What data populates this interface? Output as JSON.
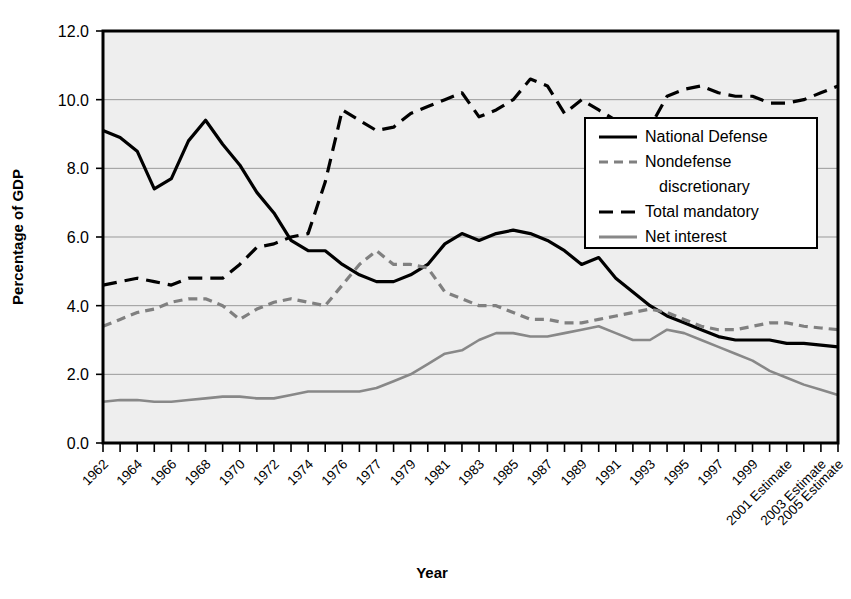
{
  "chart_data": {
    "type": "line",
    "title": "",
    "xlabel": "Year",
    "ylabel": "Percentage of GDP",
    "ylim": [
      0.0,
      12.0
    ],
    "ytick_labels": [
      "0.0",
      "2.0",
      "4.0",
      "6.0",
      "8.0",
      "10.0",
      "12.0"
    ],
    "ytick_values": [
      0,
      2,
      4,
      6,
      8,
      10,
      12
    ],
    "grid": "horizontal",
    "legend_position": "inside-right-upper",
    "x": [
      1962,
      1963,
      1964,
      1965,
      1966,
      1967,
      1968,
      1969,
      1970,
      1971,
      1972,
      1973,
      1974,
      1975,
      1976,
      1977,
      1978,
      1979,
      1980,
      1981,
      1982,
      1983,
      1984,
      1985,
      1986,
      1987,
      1988,
      1989,
      1990,
      1991,
      1992,
      1993,
      1994,
      1995,
      1996,
      1997,
      1998,
      1999,
      2000,
      2001,
      2002,
      2003,
      2004,
      2005
    ],
    "xtick_labels": [
      "1962",
      "1964",
      "1966",
      "1968",
      "1970",
      "1972",
      "1974",
      "1976",
      "1977",
      "1979",
      "1981",
      "1983",
      "1985",
      "1987",
      "1989",
      "1991",
      "1993",
      "1995",
      "1997",
      "1999",
      "2001 Estimate",
      "2003 Estimate",
      "2005 Estimate"
    ],
    "xtick_positions": [
      1962,
      1964,
      1966,
      1968,
      1970,
      1972,
      1974,
      1976,
      1978,
      1980,
      1982,
      1984,
      1986,
      1988,
      1990,
      1992,
      1994,
      1996,
      1998,
      2000,
      2002,
      2004,
      2005
    ],
    "series": [
      {
        "name": "National Defense",
        "style": "solid",
        "color": "#000000",
        "values": [
          9.1,
          8.9,
          8.5,
          7.4,
          7.7,
          8.8,
          9.4,
          8.7,
          8.1,
          7.3,
          6.7,
          5.9,
          5.6,
          5.6,
          5.2,
          4.9,
          4.7,
          4.7,
          4.9,
          5.2,
          5.8,
          6.1,
          5.9,
          6.1,
          6.2,
          6.1,
          5.9,
          5.6,
          5.2,
          5.4,
          4.8,
          4.4,
          4.0,
          3.7,
          3.5,
          3.3,
          3.1,
          3.0,
          3.0,
          3.0,
          2.9,
          2.9,
          2.85,
          2.8
        ]
      },
      {
        "name": "Nondefense discretionary",
        "style": "dashed",
        "color": "#808080",
        "values": [
          3.4,
          3.6,
          3.8,
          3.9,
          4.1,
          4.2,
          4.2,
          4.0,
          3.6,
          3.9,
          4.1,
          4.2,
          4.1,
          4.0,
          4.6,
          5.2,
          5.6,
          5.2,
          5.2,
          5.1,
          4.4,
          4.2,
          4.0,
          4.0,
          3.8,
          3.6,
          3.6,
          3.5,
          3.5,
          3.6,
          3.7,
          3.8,
          3.9,
          3.8,
          3.6,
          3.4,
          3.3,
          3.3,
          3.4,
          3.5,
          3.5,
          3.4,
          3.35,
          3.3
        ]
      },
      {
        "name": "Total mandatory",
        "style": "longdash",
        "color": "#000000",
        "values": [
          4.6,
          4.7,
          4.8,
          4.7,
          4.6,
          4.8,
          4.8,
          4.8,
          5.2,
          5.7,
          5.8,
          6.0,
          6.1,
          7.6,
          9.7,
          9.4,
          9.1,
          9.2,
          9.6,
          9.8,
          10.0,
          10.2,
          9.5,
          9.7,
          10.0,
          10.6,
          10.4,
          9.6,
          10.0,
          9.7,
          9.4,
          8.9,
          9.2,
          10.1,
          10.3,
          10.4,
          10.2,
          10.1,
          10.1,
          9.9,
          9.9,
          10.0,
          10.2,
          10.4
        ]
      },
      {
        "name": "Net interest",
        "style": "solid",
        "color": "#888888",
        "values": [
          1.2,
          1.25,
          1.25,
          1.2,
          1.2,
          1.25,
          1.3,
          1.35,
          1.35,
          1.3,
          1.3,
          1.4,
          1.5,
          1.5,
          1.5,
          1.5,
          1.6,
          1.8,
          2.0,
          2.3,
          2.6,
          2.7,
          3.0,
          3.2,
          3.2,
          3.1,
          3.1,
          3.2,
          3.3,
          3.4,
          3.2,
          3.0,
          3.0,
          3.3,
          3.2,
          3.0,
          2.8,
          2.6,
          2.4,
          2.1,
          1.9,
          1.7,
          1.55,
          1.4
        ]
      }
    ]
  },
  "legend": {
    "items": [
      {
        "label": "National Defense"
      },
      {
        "label": "Nondefense"
      },
      {
        "label": "discretionary"
      },
      {
        "label": "Total mandatory"
      },
      {
        "label": "Net interest"
      }
    ]
  },
  "axes": {
    "y_title": "Percentage of GDP",
    "x_title": "Year"
  },
  "colors": {
    "plot_background": "#eeeeee",
    "grid": "#999999",
    "axis": "#000000",
    "defense": "#000000",
    "nondefense": "#808080",
    "mandatory": "#000000",
    "interest": "#888888"
  }
}
